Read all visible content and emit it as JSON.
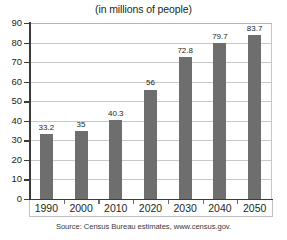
{
  "chart_data": {
    "type": "bar",
    "title": "(in millions of people)",
    "xlabel": "",
    "ylabel": "",
    "categories": [
      "1990",
      "2000",
      "2010",
      "2020",
      "2030",
      "2040",
      "2050"
    ],
    "values": [
      33.2,
      35,
      40.3,
      56,
      72.8,
      79.7,
      83.7
    ],
    "value_labels": [
      "33.2",
      "35",
      "40.3",
      "56",
      "72.8",
      "79.7",
      "83.7"
    ],
    "ylim": [
      0,
      90
    ],
    "ytick_labels": [
      "0",
      "10",
      "20",
      "30",
      "40",
      "50",
      "60",
      "70",
      "80",
      "90"
    ],
    "ytick_values": [
      0,
      10,
      20,
      30,
      40,
      50,
      60,
      70,
      80,
      90
    ],
    "grid": true,
    "legend": null,
    "bar_color": "#6e6e6e",
    "gridline_color": "#c8c8c8",
    "axis_color": "#3b3b3b",
    "background_color": "#ffffff",
    "source_note": "Source: Census Bureau estimates, www.census.gov."
  }
}
